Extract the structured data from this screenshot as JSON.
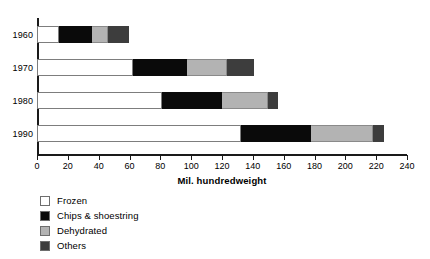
{
  "chart_data": {
    "type": "bar",
    "orientation": "horizontal",
    "stacked": true,
    "title": "",
    "xlabel": "Mil. hundredweight",
    "ylabel": "",
    "xlim": [
      0,
      240
    ],
    "xticks": [
      0,
      20,
      40,
      60,
      80,
      100,
      120,
      140,
      160,
      180,
      200,
      220,
      240
    ],
    "xtick_labels": [
      "0",
      "20",
      "40",
      "60",
      "80",
      "100",
      "120",
      "140",
      "160",
      "180",
      "200",
      "220",
      "240"
    ],
    "grid": false,
    "legend_position": "below-left",
    "categories": [
      "1960",
      "1970",
      "1980",
      "1990"
    ],
    "series": [
      {
        "name": "Frozen",
        "color": "#ffffff",
        "values": [
          14,
          62,
          81,
          132
        ]
      },
      {
        "name": "Chips & shoestring",
        "color": "#0a0a0a",
        "values": [
          22,
          35,
          39,
          46
        ]
      },
      {
        "name": "Dehydrated",
        "color": "#b3b3b3",
        "values": [
          10,
          26,
          30,
          40
        ]
      },
      {
        "name": "Others",
        "color": "#3d3d3d",
        "values": [
          14,
          18,
          6,
          7
        ]
      }
    ],
    "totals": [
      60,
      141,
      156,
      225
    ]
  },
  "axis": {
    "title": "Mil. hundredweight"
  },
  "legend": {
    "items": [
      {
        "label": "Frozen"
      },
      {
        "label": "Chips & shoestring"
      },
      {
        "label": "Dehydrated"
      },
      {
        "label": "Others"
      }
    ]
  }
}
